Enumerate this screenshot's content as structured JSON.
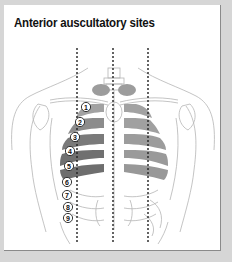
{
  "figure": {
    "title": "Anterior auscultatory sites",
    "sites": [
      {
        "label": "1",
        "x": 86,
        "y": 107
      },
      {
        "label": "2",
        "x": 80,
        "y": 122
      },
      {
        "label": "3",
        "x": 75,
        "y": 137
      },
      {
        "label": "4",
        "x": 70,
        "y": 151
      },
      {
        "label": "5",
        "x": 69,
        "y": 166
      },
      {
        "label": "6",
        "x": 67,
        "y": 182
      },
      {
        "label": "7",
        "x": 67,
        "y": 195
      },
      {
        "label": "8",
        "x": 68,
        "y": 207
      },
      {
        "label": "9",
        "x": 68,
        "y": 218
      }
    ],
    "guide_lines_x": [
      77,
      113,
      148
    ],
    "colors": {
      "background": "#d6d6d6",
      "panel": "#ffffff",
      "lung_light": "#9c9c9c",
      "lung_dark": "#707070",
      "outline": "#b0b0b0",
      "guide": "#222222"
    }
  }
}
